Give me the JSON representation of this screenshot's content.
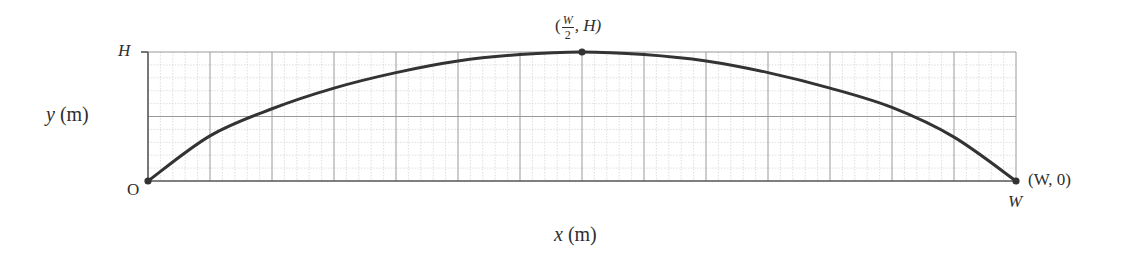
{
  "chart_data": {
    "type": "line",
    "title": "",
    "xlabel_var": "x",
    "xlabel_unit": "(m)",
    "ylabel_var": "y",
    "ylabel_unit": "(m)",
    "xlabel": "x (m)",
    "ylabel": "y (m)",
    "x_ticks": [
      "O",
      "W"
    ],
    "y_ticks": [
      "O",
      "H"
    ],
    "xlim": [
      0,
      1
    ],
    "ylim": [
      0,
      1
    ],
    "x_units": "fraction of W",
    "y_units": "fraction of H",
    "grid": {
      "on": true,
      "major_columns": 14,
      "major_rows": 2,
      "minor_per_major": 5
    },
    "series": [
      {
        "name": "trajectory",
        "x": [
          0,
          0.0714,
          0.1429,
          0.2143,
          0.2857,
          0.3571,
          0.4286,
          0.5,
          0.5714,
          0.6429,
          0.7143,
          0.7857,
          0.8571,
          0.9286,
          1.0
        ],
        "y": [
          0,
          0.35,
          0.56,
          0.72,
          0.84,
          0.93,
          0.98,
          1.0,
          0.98,
          0.93,
          0.84,
          0.72,
          0.57,
          0.34,
          0
        ]
      }
    ],
    "annotations": [
      {
        "point": "origin",
        "x": 0,
        "y": 0,
        "label": "O"
      },
      {
        "point": "apex",
        "x": 0.5,
        "y": 1.0,
        "label_prefix": "(",
        "frac_num": "W",
        "frac_den": "2",
        "label_suffix": ", H)"
      },
      {
        "point": "landing",
        "x": 1.0,
        "y": 0,
        "label": "(W, 0)"
      }
    ]
  },
  "labels": {
    "y_tick_H": "H",
    "origin": "O",
    "x_tick_W": "W",
    "apex_prefix": "(",
    "apex_num": "W",
    "apex_den": "2",
    "apex_suffix": ", H)",
    "landing": "(W, 0)",
    "xlabel_var": "x",
    "xlabel_unit": "(m)",
    "ylabel_var": "y",
    "ylabel_unit": "(m)"
  },
  "colors": {
    "curve": "#333333",
    "axis": "#555555",
    "major_grid": "#9a9a9a",
    "minor_grid": "#d6d6d6",
    "text": "#2e2e2e"
  }
}
